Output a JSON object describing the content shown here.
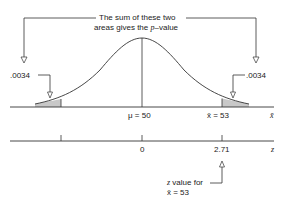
{
  "annotation": {
    "line1": "The sum of these two",
    "line2_prefix": "areas gives the ",
    "line2_var": "p",
    "line2_suffix": "–value"
  },
  "tail_left": {
    "area": ".0034"
  },
  "tail_right": {
    "area": ".0034"
  },
  "xbar_axis": {
    "mu_label": "μ = 50",
    "xbar_label": "x̄ = 53",
    "axis_symbol": "x̄"
  },
  "z_axis": {
    "zero_label": "0",
    "z_label": "2.71",
    "axis_symbol": "z"
  },
  "z_note": {
    "line1_var": "z",
    "line1_rest": " value for",
    "line2": "x̄ = 53"
  },
  "colors": {
    "line": "#333333",
    "shade": "#c8c8c8"
  }
}
